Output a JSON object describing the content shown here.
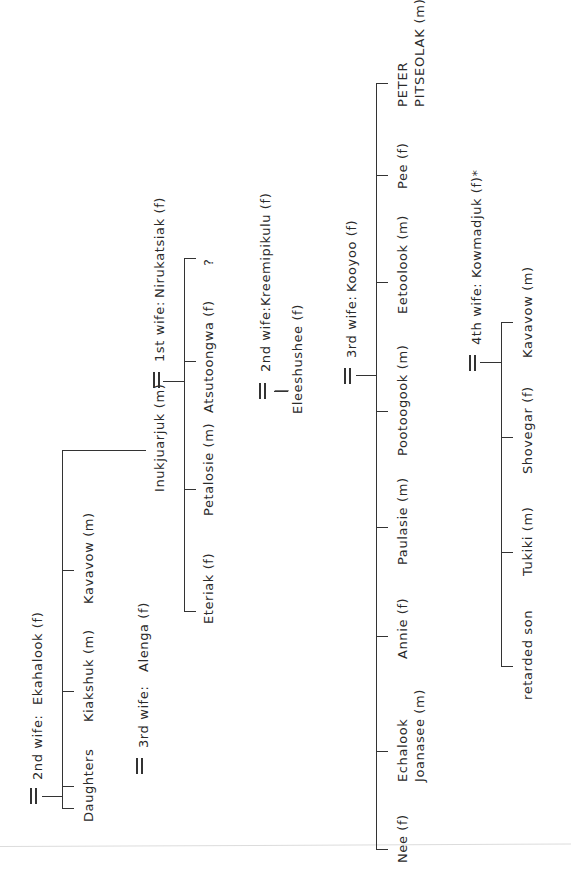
{
  "diagram": {
    "orientation": "rotated 90 degrees counter-clockwise",
    "branches": [
      {
        "spouse_label": "2nd wife:",
        "spouse_name": "Ekahalook (f)",
        "children": [
          "Daughters",
          "Kiakshuk (m)",
          "Kavavow (m)",
          "Inukjuarjuk (m)"
        ]
      },
      {
        "spouse_label": "3rd wife:",
        "spouse_name": "Alenga (f)",
        "children": []
      }
    ],
    "inukjuarjuk": {
      "name": "Inukjuarjuk (m)",
      "wives": [
        {
          "spouse_label": "1st wife:",
          "spouse_name": "Nirukatsiak (f)",
          "children": [
            "Eteriak (f)",
            "Petalosie (m)",
            "Atsutoongwa (f)",
            "?"
          ]
        },
        {
          "spouse_label": "2nd wife:",
          "spouse_name": "Kreemipikulu (f)",
          "children": [
            "Eleeshushee (f)"
          ]
        },
        {
          "spouse_label": "3rd wife:",
          "spouse_name": "Kooyoo (f)",
          "children": [
            "Nee (f)",
            "Echalook",
            "Joanasee (m)",
            "Annie (f)",
            "Paulasie (m)",
            "Pootoogook (m)",
            "Eetoolook (m)",
            "Pee (f)",
            "PETER",
            "PITSEOLAK (m)"
          ]
        },
        {
          "spouse_label": "4th wife:",
          "spouse_name": "Kowmadjuk (f)*",
          "children": [
            "retarded son",
            "Tukiki (m)",
            "Shovegar (f)",
            "Kavavow (m)"
          ]
        }
      ]
    },
    "marriage_symbol": "═"
  }
}
